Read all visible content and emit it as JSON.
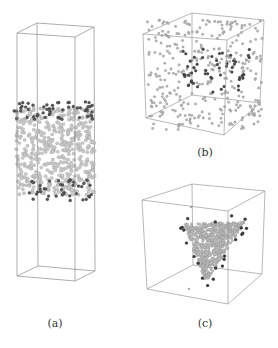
{
  "figure": {
    "panels": [
      {
        "id": "a",
        "label": "(a)",
        "label_pos": [
          55,
          317
        ],
        "box": {
          "front": [
            [
              17,
              33
            ],
            [
              75,
              37
            ],
            [
              75,
              281
            ],
            [
              17,
              276
            ]
          ],
          "back": [
            [
              37,
              23
            ],
            [
              94,
              27
            ],
            [
              95,
              271
            ],
            [
              38,
              266
            ]
          ]
        },
        "edge_color": "#8a8a8a",
        "particles": {
          "bulk": {
            "count": 520,
            "region": {
              "type": "rect",
              "x": [
                16,
                95
              ],
              "y": [
                108,
                195
              ]
            },
            "color": "#c9c9c9",
            "radius": 1.7
          },
          "surface_top": {
            "count": 55,
            "region": {
              "type": "band",
              "x": [
                14,
                95
              ],
              "y": [
                101,
                120
              ]
            },
            "color": "#555555",
            "radius": 1.6
          },
          "surface_bottom": {
            "count": 40,
            "region": {
              "type": "band",
              "x": [
                28,
                95
              ],
              "y": [
                180,
                201
              ]
            },
            "color": "#555555",
            "radius": 1.6
          }
        }
      },
      {
        "id": "b",
        "label": "(b)",
        "label_pos": [
          205,
          146
        ],
        "box": {
          "front": [
            [
              143,
              34
            ],
            [
              227,
              40
            ],
            [
              224,
              135
            ],
            [
              146,
              118
            ]
          ],
          "back": [
            [
              192,
              13
            ],
            [
              264,
              20
            ],
            [
              260,
              103
            ],
            [
              192,
              95
            ]
          ]
        },
        "edge_color": "#9a9a9a",
        "particles": {
          "gas": {
            "count": 330,
            "region": {
              "type": "rect",
              "x": [
                147,
                262
              ],
              "y": [
                20,
                130
              ]
            },
            "color": "#b5b5b5",
            "radius": 1.3
          },
          "strings": {
            "count": 55,
            "region": {
              "type": "rect",
              "x": [
                183,
                250
              ],
              "y": [
                45,
                92
              ]
            },
            "color": "#4a4a4a",
            "radius": 1.5
          }
        }
      },
      {
        "id": "c",
        "label": "(c)",
        "label_pos": [
          205,
          317
        ],
        "box": {
          "front": [
            [
              142,
              200
            ],
            [
              228,
              211
            ],
            [
              228,
              304
            ],
            [
              147,
              289
            ]
          ],
          "back": [
            [
              192,
              184
            ],
            [
              265,
              191
            ],
            [
              262,
              274
            ],
            [
              193,
              265
            ]
          ]
        },
        "edge_color": "#9a9a9a",
        "particles": {
          "cluster": {
            "count": 650,
            "region": {
              "type": "triangle",
              "pts": [
                [
                  183,
                  224
                ],
                [
                  245,
                  222
                ],
                [
                  206,
                  282
                ]
              ]
            },
            "color": "#bdbdbd",
            "radius": 1.3
          },
          "cluster_surface": {
            "count": 22,
            "region": {
              "type": "triangle",
              "pts": [
                [
                  180,
                  220
                ],
                [
                  250,
                  218
                ],
                [
                  206,
                  288
                ]
              ]
            },
            "color": "#3e3e3e",
            "radius": 1.6
          },
          "gas": {
            "count": 2,
            "points": [
              [
                191,
                207
              ],
              [
                189,
                289
              ]
            ],
            "color": "#aaaaaa",
            "radius": 1.1
          }
        }
      }
    ]
  }
}
